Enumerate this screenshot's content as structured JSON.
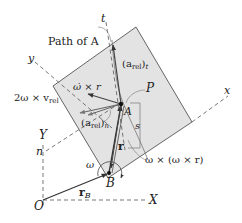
{
  "diagram": {
    "labels": {
      "path_of_a": "Path of A",
      "t_axis": "t",
      "y_axis": "y",
      "x_axis": "x",
      "n_axis": "n",
      "Y_axis": "Y",
      "X_axis": "X",
      "origin": "O",
      "point_a": "A",
      "point_b": "B",
      "point_p": "P",
      "s_label": "s",
      "omega_dot_cross_r": "ω̇ × r",
      "coriolis": "2ω × v",
      "coriolis_sub": "rel",
      "a_rel_t": "(a",
      "a_rel_t_sub": "rel",
      "a_rel_t_close": ")",
      "a_rel_t_sub2": "t",
      "a_rel_n": "(a",
      "a_rel_n_sub": "rel",
      "a_rel_n_close": ")",
      "a_rel_n_sub2": "n",
      "r_vec": "r",
      "r_b": "r",
      "r_b_sub": "B",
      "omega": "ω",
      "centripetal": "ω × (ω × r)"
    },
    "colors": {
      "plate_fill": "#e3e3e3",
      "plate_edge": "#555555",
      "line": "#333333",
      "dash": "#555555"
    }
  }
}
